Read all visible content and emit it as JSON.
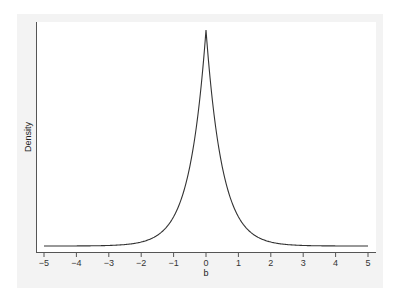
{
  "chart_data": {
    "type": "line",
    "title": "",
    "xlabel": "b",
    "ylabel": "Density",
    "xlim": [
      -5,
      5
    ],
    "xticks": [
      -5,
      -4,
      -3,
      -2,
      -1,
      0,
      1,
      2,
      3,
      4,
      5
    ],
    "xtick_labels": [
      "-5",
      "-4",
      "-3",
      "-2",
      "-1",
      "0",
      "1",
      "2",
      "3",
      "4",
      "5"
    ],
    "yticks": [],
    "grid": false,
    "legend": null,
    "series": [
      {
        "name": "density",
        "distribution": "Laplace (double exponential), location 0, scale ~0.5",
        "x": [
          -5,
          -4,
          -3,
          -2,
          -1.5,
          -1,
          -0.75,
          -0.5,
          -0.25,
          0,
          0.25,
          0.5,
          0.75,
          1,
          1.5,
          2,
          3,
          4,
          5
        ],
        "y": [
          5e-05,
          0.0003,
          0.0025,
          0.018,
          0.05,
          0.135,
          0.22,
          0.37,
          0.61,
          1.0,
          0.61,
          0.37,
          0.22,
          0.135,
          0.05,
          0.018,
          0.0025,
          0.0003,
          5e-05
        ]
      }
    ]
  }
}
